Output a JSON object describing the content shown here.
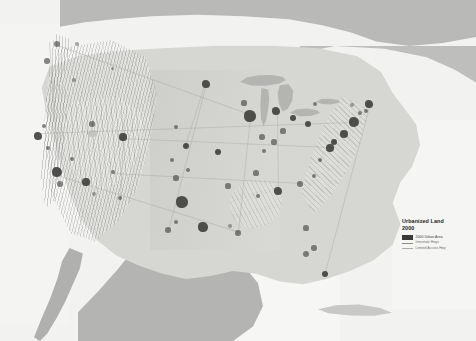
{
  "figure": {
    "name": "urbanized-land-map"
  },
  "legend": {
    "title": "Urbanized Land",
    "year": "2000",
    "entries": [
      {
        "label": "2000 Urban Area",
        "symbol": "filled-swatch",
        "color": "#3a3a38"
      },
      {
        "label": "Interstate Hwys",
        "symbol": "line",
        "color": "#8d8d8a"
      },
      {
        "label": "Limited Access Hwy",
        "symbol": "thin-line",
        "color": "#aaaaa7"
      }
    ]
  },
  "map_layers": {
    "water_color": "#f4f4f3",
    "us_land_color": "#d6d6d3",
    "foreign_land_color": "#b4b4b2",
    "urban_color": "#3a3a38",
    "highway_color": "#a8a8a4",
    "lake_color": "#b4b4b2"
  },
  "regions": [
    {
      "name": "canada",
      "type": "foreign-land"
    },
    {
      "name": "mexico",
      "type": "foreign-land"
    },
    {
      "name": "baja-california",
      "type": "foreign-land"
    },
    {
      "name": "cuba",
      "type": "foreign-land"
    },
    {
      "name": "contiguous-united-states",
      "type": "us-land"
    },
    {
      "name": "pacific-ocean",
      "type": "water"
    },
    {
      "name": "gulf-of-mexico",
      "type": "water"
    },
    {
      "name": "atlantic-ocean",
      "type": "water"
    },
    {
      "name": "great-lakes",
      "type": "water"
    }
  ],
  "urban_areas": [
    {
      "name": "seattle",
      "x": 57,
      "y": 44,
      "r": 3.4,
      "weight": "soft"
    },
    {
      "name": "portland",
      "x": 47,
      "y": 61,
      "r": 2.8,
      "weight": "soft"
    },
    {
      "name": "spokane",
      "x": 77,
      "y": 44,
      "r": 1.8,
      "weight": "faint"
    },
    {
      "name": "boise",
      "x": 74,
      "y": 80,
      "r": 1.7,
      "weight": "faint"
    },
    {
      "name": "san-francisco",
      "x": 38,
      "y": 136,
      "r": 4.0,
      "weight": "full"
    },
    {
      "name": "sacramento",
      "x": 44,
      "y": 126,
      "r": 2.4,
      "weight": "soft"
    },
    {
      "name": "fresno",
      "x": 48,
      "y": 148,
      "r": 2.0,
      "weight": "soft"
    },
    {
      "name": "los-angeles",
      "x": 57,
      "y": 172,
      "r": 5.2,
      "weight": "full"
    },
    {
      "name": "san-diego",
      "x": 60,
      "y": 184,
      "r": 2.8,
      "weight": "soft"
    },
    {
      "name": "las-vegas",
      "x": 72,
      "y": 159,
      "r": 2.4,
      "weight": "soft"
    },
    {
      "name": "phoenix",
      "x": 86,
      "y": 182,
      "r": 3.6,
      "weight": "full"
    },
    {
      "name": "tucson",
      "x": 94,
      "y": 194,
      "r": 2.0,
      "weight": "faint"
    },
    {
      "name": "salt-lake-city",
      "x": 92,
      "y": 124,
      "r": 2.8,
      "weight": "soft"
    },
    {
      "name": "albuquerque",
      "x": 113,
      "y": 172,
      "r": 2.2,
      "weight": "soft"
    },
    {
      "name": "el-paso",
      "x": 120,
      "y": 198,
      "r": 2.4,
      "weight": "soft"
    },
    {
      "name": "denver",
      "x": 123,
      "y": 137,
      "r": 3.6,
      "weight": "full"
    },
    {
      "name": "billings",
      "x": 112,
      "y": 68,
      "r": 1.5,
      "weight": "faint"
    },
    {
      "name": "minneapolis",
      "x": 206,
      "y": 84,
      "r": 4.0,
      "weight": "full"
    },
    {
      "name": "omaha",
      "x": 176,
      "y": 127,
      "r": 2.4,
      "weight": "soft"
    },
    {
      "name": "kansas-city",
      "x": 186,
      "y": 146,
      "r": 3.0,
      "weight": "full"
    },
    {
      "name": "wichita",
      "x": 172,
      "y": 160,
      "r": 2.0,
      "weight": "soft"
    },
    {
      "name": "oklahoma-city",
      "x": 176,
      "y": 178,
      "r": 2.6,
      "weight": "soft"
    },
    {
      "name": "tulsa",
      "x": 188,
      "y": 170,
      "r": 2.2,
      "weight": "soft"
    },
    {
      "name": "dallas-fort-worth",
      "x": 182,
      "y": 202,
      "r": 5.6,
      "weight": "full"
    },
    {
      "name": "austin",
      "x": 176,
      "y": 222,
      "r": 2.4,
      "weight": "soft"
    },
    {
      "name": "san-antonio",
      "x": 168,
      "y": 230,
      "r": 2.8,
      "weight": "soft"
    },
    {
      "name": "houston",
      "x": 203,
      "y": 227,
      "r": 4.6,
      "weight": "full"
    },
    {
      "name": "new-orleans",
      "x": 238,
      "y": 233,
      "r": 2.8,
      "weight": "soft"
    },
    {
      "name": "baton-rouge",
      "x": 230,
      "y": 226,
      "r": 1.8,
      "weight": "faint"
    },
    {
      "name": "memphis",
      "x": 228,
      "y": 186,
      "r": 2.6,
      "weight": "soft"
    },
    {
      "name": "st-louis",
      "x": 218,
      "y": 152,
      "r": 3.4,
      "weight": "full"
    },
    {
      "name": "chicago",
      "x": 250,
      "y": 116,
      "r": 5.6,
      "weight": "full"
    },
    {
      "name": "milwaukee",
      "x": 244,
      "y": 103,
      "r": 2.6,
      "weight": "soft"
    },
    {
      "name": "indianapolis",
      "x": 262,
      "y": 137,
      "r": 2.8,
      "weight": "soft"
    },
    {
      "name": "detroit",
      "x": 276,
      "y": 111,
      "r": 4.4,
      "weight": "full"
    },
    {
      "name": "cleveland",
      "x": 293,
      "y": 118,
      "r": 3.4,
      "weight": "full"
    },
    {
      "name": "columbus",
      "x": 283,
      "y": 131,
      "r": 2.6,
      "weight": "soft"
    },
    {
      "name": "cincinnati",
      "x": 274,
      "y": 142,
      "r": 2.6,
      "weight": "soft"
    },
    {
      "name": "louisville",
      "x": 264,
      "y": 151,
      "r": 2.2,
      "weight": "soft"
    },
    {
      "name": "nashville",
      "x": 256,
      "y": 173,
      "r": 2.6,
      "weight": "soft"
    },
    {
      "name": "birmingham",
      "x": 258,
      "y": 196,
      "r": 2.2,
      "weight": "soft"
    },
    {
      "name": "atlanta",
      "x": 278,
      "y": 191,
      "r": 4.4,
      "weight": "full"
    },
    {
      "name": "pittsburgh",
      "x": 308,
      "y": 124,
      "r": 3.0,
      "weight": "full"
    },
    {
      "name": "buffalo",
      "x": 315,
      "y": 104,
      "r": 2.2,
      "weight": "soft"
    },
    {
      "name": "charlotte",
      "x": 300,
      "y": 184,
      "r": 2.8,
      "weight": "soft"
    },
    {
      "name": "raleigh",
      "x": 314,
      "y": 176,
      "r": 2.4,
      "weight": "soft"
    },
    {
      "name": "richmond",
      "x": 320,
      "y": 160,
      "r": 2.4,
      "weight": "soft"
    },
    {
      "name": "washington-dc",
      "x": 330,
      "y": 148,
      "r": 3.8,
      "weight": "full"
    },
    {
      "name": "baltimore",
      "x": 334,
      "y": 142,
      "r": 3.0,
      "weight": "full"
    },
    {
      "name": "philadelphia",
      "x": 344,
      "y": 134,
      "r": 3.8,
      "weight": "full"
    },
    {
      "name": "new-york",
      "x": 354,
      "y": 122,
      "r": 5.4,
      "weight": "full"
    },
    {
      "name": "hartford",
      "x": 360,
      "y": 113,
      "r": 2.2,
      "weight": "soft"
    },
    {
      "name": "boston",
      "x": 369,
      "y": 104,
      "r": 4.0,
      "weight": "full"
    },
    {
      "name": "providence",
      "x": 366,
      "y": 111,
      "r": 2.0,
      "weight": "soft"
    },
    {
      "name": "albany",
      "x": 352,
      "y": 105,
      "r": 2.0,
      "weight": "faint"
    },
    {
      "name": "jacksonville",
      "x": 306,
      "y": 228,
      "r": 2.6,
      "weight": "soft"
    },
    {
      "name": "orlando",
      "x": 314,
      "y": 248,
      "r": 2.8,
      "weight": "soft"
    },
    {
      "name": "tampa",
      "x": 306,
      "y": 254,
      "r": 3.0,
      "weight": "soft"
    },
    {
      "name": "miami",
      "x": 325,
      "y": 274,
      "r": 3.4,
      "weight": "full"
    }
  ],
  "highways": [
    {
      "name": "i-5-west-coast",
      "x1": 50,
      "y1": 42,
      "x2": 60,
      "y2": 186
    },
    {
      "name": "i-10-southern",
      "x1": 58,
      "y1": 175,
      "x2": 240,
      "y2": 232
    },
    {
      "name": "i-80-transcon",
      "x1": 40,
      "y1": 133,
      "x2": 352,
      "y2": 122
    },
    {
      "name": "i-90-northern",
      "x1": 58,
      "y1": 45,
      "x2": 250,
      "y2": 114
    },
    {
      "name": "i-70-central",
      "x1": 122,
      "y1": 138,
      "x2": 330,
      "y2": 147
    },
    {
      "name": "i-35-texas-spine",
      "x1": 168,
      "y1": 231,
      "x2": 206,
      "y2": 84
    },
    {
      "name": "i-95-northeast",
      "x1": 325,
      "y1": 272,
      "x2": 370,
      "y2": 103
    },
    {
      "name": "i-25-rockies",
      "x1": 120,
      "y1": 198,
      "x2": 124,
      "y2": 120
    },
    {
      "name": "i-75-southeast",
      "x1": 278,
      "y1": 192,
      "x2": 277,
      "y2": 111
    },
    {
      "name": "i-55-mississippi",
      "x1": 238,
      "y1": 232,
      "x2": 250,
      "y2": 118
    },
    {
      "name": "i-40-midsouth",
      "x1": 113,
      "y1": 173,
      "x2": 302,
      "y2": 183
    },
    {
      "name": "i-29-plains",
      "x1": 205,
      "y1": 86,
      "x2": 186,
      "y2": 146
    }
  ]
}
